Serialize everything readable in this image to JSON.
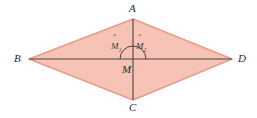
{
  "figure": {
    "name": "rhombus-diagonals-diagram",
    "type": "geometry-diagram",
    "background_color": "#ffffff"
  },
  "style": {
    "fill_color": "#f7c3b6",
    "outline_color": "#e79c8c",
    "diagonal_color": "#4a4440",
    "arc_color": "#4a4440",
    "label_color": "#2b2b2b"
  },
  "shape": {
    "kind": "rhombus",
    "vertex_order": "A-B-C-D",
    "points": [
      {
        "name": "A",
        "x": 133,
        "y": 19
      },
      {
        "name": "B",
        "x": 29,
        "y": 59
      },
      {
        "name": "C",
        "x": 133,
        "y": 100
      },
      {
        "name": "D",
        "x": 232,
        "y": 59
      }
    ]
  },
  "center": {
    "name": "M",
    "x": 133,
    "y": 59
  },
  "diagonals": [
    {
      "name": "AC",
      "from": "A",
      "to": "C",
      "orientation": "vertical"
    },
    {
      "name": "BD",
      "from": "B",
      "to": "D",
      "orientation": "horizontal"
    }
  ],
  "labels": {
    "A": "A",
    "B": "B",
    "C": "C",
    "D": "D",
    "M": "M"
  },
  "angles": [
    {
      "id": "M1",
      "base": "M",
      "subscript": "1",
      "accent": "hat",
      "position": "upper-left-of-center"
    },
    {
      "id": "M2",
      "base": "M",
      "subscript": "2",
      "accent": "hat",
      "position": "upper-right-of-center"
    }
  ],
  "arc": {
    "name": "angle-arc-at-M",
    "radius": 13,
    "spans": "from-left-ray-to-right-ray-through-top"
  }
}
